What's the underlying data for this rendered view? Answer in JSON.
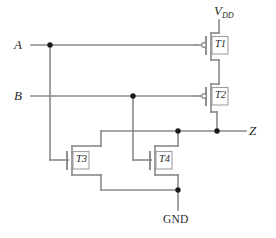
{
  "diagram": {
    "kind": "transistor-level schematic",
    "ports": {
      "input_a": "A",
      "input_b": "B",
      "output_z": "Z",
      "supply": "V",
      "supply_sub": "DD",
      "ground": "GND"
    },
    "devices": [
      {
        "id": "t1",
        "label": "T1",
        "type": "pmos",
        "gate_input": "A",
        "gate_bubble": true
      },
      {
        "id": "t2",
        "label": "T2",
        "type": "pmos",
        "gate_input": "B",
        "gate_bubble": true
      },
      {
        "id": "t3",
        "label": "T3",
        "type": "nmos",
        "gate_input": "A",
        "gate_bubble": false
      },
      {
        "id": "t4",
        "label": "T4",
        "type": "nmos",
        "gate_input": "B",
        "gate_bubble": false
      }
    ],
    "colors": {
      "wire": "#8a8a8a",
      "device_outline": "#a0a0a0",
      "node_dot": "#1a1a1a",
      "text": "#2b2b2b",
      "background": "#ffffff"
    },
    "nodes": [
      {
        "name": "a-branch-tap",
        "x": 50,
        "y": 45
      },
      {
        "name": "b-branch-tap",
        "x": 133,
        "y": 96
      },
      {
        "name": "t4-drain-tap",
        "x": 178,
        "y": 131
      },
      {
        "name": "output-tap",
        "x": 217,
        "y": 131
      },
      {
        "name": "ground-tap",
        "x": 178,
        "y": 190
      }
    ]
  }
}
